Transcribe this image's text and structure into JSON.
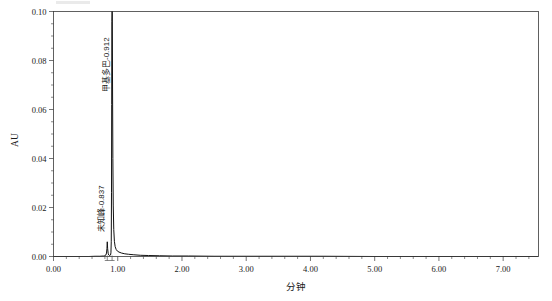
{
  "chart_data": {
    "type": "line",
    "title": "",
    "xlabel": "分钟",
    "ylabel": "AU",
    "xlim": [
      0.0,
      7.55
    ],
    "ylim": [
      0.0,
      0.1
    ],
    "grid": false,
    "legend": "none",
    "x_ticks": [
      "0.00",
      "1.00",
      "2.00",
      "3.00",
      "4.00",
      "5.00",
      "6.00",
      "7.00"
    ],
    "x_tick_values": [
      0.0,
      1.0,
      2.0,
      3.0,
      4.0,
      5.0,
      6.0,
      7.0
    ],
    "x_minor_step": 0.2,
    "y_ticks": [
      "0.00",
      "0.02",
      "0.04",
      "0.06",
      "0.08",
      "0.10"
    ],
    "y_tick_values": [
      0.0,
      0.02,
      0.04,
      0.06,
      0.08,
      0.1
    ],
    "y_minor_step": 0.005,
    "series": [
      {
        "name": "detector-trace",
        "color": "#111111",
        "points": [
          [
            0.0,
            0.0
          ],
          [
            0.2,
            0.0
          ],
          [
            0.4,
            0.0
          ],
          [
            0.55,
            0.0
          ],
          [
            0.65,
            0.0001
          ],
          [
            0.72,
            0.0001
          ],
          [
            0.78,
            0.0002
          ],
          [
            0.8,
            0.0003
          ],
          [
            0.815,
            0.0006
          ],
          [
            0.825,
            0.0014
          ],
          [
            0.832,
            0.0032
          ],
          [
            0.837,
            0.006
          ],
          [
            0.843,
            0.0032
          ],
          [
            0.851,
            0.0013
          ],
          [
            0.86,
            0.0006
          ],
          [
            0.87,
            0.0004
          ],
          [
            0.88,
            0.0004
          ],
          [
            0.888,
            0.0006
          ],
          [
            0.894,
            0.0015
          ],
          [
            0.899,
            0.006
          ],
          [
            0.903,
            0.026
          ],
          [
            0.906,
            0.062
          ],
          [
            0.909,
            0.096
          ],
          [
            0.912,
            0.108
          ],
          [
            0.915,
            0.099
          ],
          [
            0.919,
            0.07
          ],
          [
            0.924,
            0.04
          ],
          [
            0.93,
            0.021
          ],
          [
            0.938,
            0.011
          ],
          [
            0.948,
            0.0062
          ],
          [
            0.96,
            0.004
          ],
          [
            0.975,
            0.0029
          ],
          [
            0.995,
            0.0022
          ],
          [
            1.02,
            0.0018
          ],
          [
            1.06,
            0.0014
          ],
          [
            1.11,
            0.0011
          ],
          [
            1.17,
            0.0009
          ],
          [
            1.25,
            0.0007
          ],
          [
            1.35,
            0.0005
          ],
          [
            1.48,
            0.0004
          ],
          [
            1.65,
            0.0003
          ],
          [
            1.85,
            0.0002
          ],
          [
            2.1,
            0.0002
          ],
          [
            2.5,
            0.0001
          ],
          [
            3.0,
            0.0001
          ],
          [
            3.6,
            0.0001
          ],
          [
            4.2,
            0.0001
          ],
          [
            5.0,
            0.0
          ],
          [
            5.8,
            0.0
          ],
          [
            6.6,
            0.0
          ],
          [
            7.2,
            0.0
          ],
          [
            7.55,
            0.0
          ]
        ]
      }
    ],
    "peaks": [
      {
        "id": "peak-unknown",
        "label": "未知峰-0.837",
        "name": "未知峰",
        "retention_time": 0.837,
        "label_rotation": -90
      },
      {
        "id": "peak-methyldopa",
        "label": "甲基多巴-0.912",
        "name": "甲基多巴",
        "retention_time": 0.912,
        "label_rotation": -90
      }
    ],
    "annotations": []
  },
  "colors": {
    "trace": "#111111",
    "axis": "#3a3a3a",
    "background": "#ffffff"
  }
}
